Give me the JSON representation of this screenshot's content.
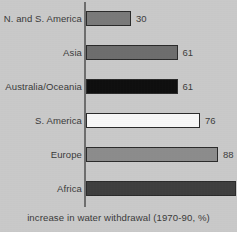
{
  "chart_data": {
    "type": "bar",
    "orientation": "horizontal",
    "title": "",
    "xlabel": "increase in water withdrawal (1970-90, %)",
    "ylabel": "",
    "categories": [
      "N. and S. America",
      "Asia",
      "Australia/Oceania",
      "S. America",
      "Europe",
      "Africa"
    ],
    "values": [
      30,
      61,
      61,
      76,
      88,
      100
    ],
    "value_labels": [
      "30",
      "61",
      "61",
      "76",
      "88",
      "100"
    ],
    "bar_colors": [
      "#7a7a7a",
      "#6e6e6e",
      "#0f0f0f",
      "#f7f7f7",
      "#8c8c8c",
      "#3f3f3f"
    ],
    "bar_border_color": "#2b2b2b",
    "xlim": [
      0,
      100
    ],
    "grid": false,
    "legend": false,
    "axis_color": "#6e6e6e",
    "background_color": "#c9c9c9"
  },
  "caption": {
    "text": "increase in water withdrawal (1970-90, %)"
  }
}
